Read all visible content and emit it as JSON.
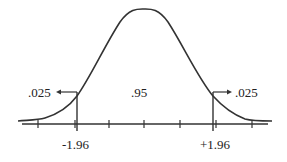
{
  "diagram": {
    "type": "normal-distribution",
    "labels": {
      "left_tail": ".025",
      "center": ".95",
      "right_tail": ".025",
      "left_critical": "-1.96",
      "right_critical": "+1.96"
    },
    "colors": {
      "stroke": "#333333",
      "text": "#222222",
      "background": "#ffffff"
    }
  }
}
